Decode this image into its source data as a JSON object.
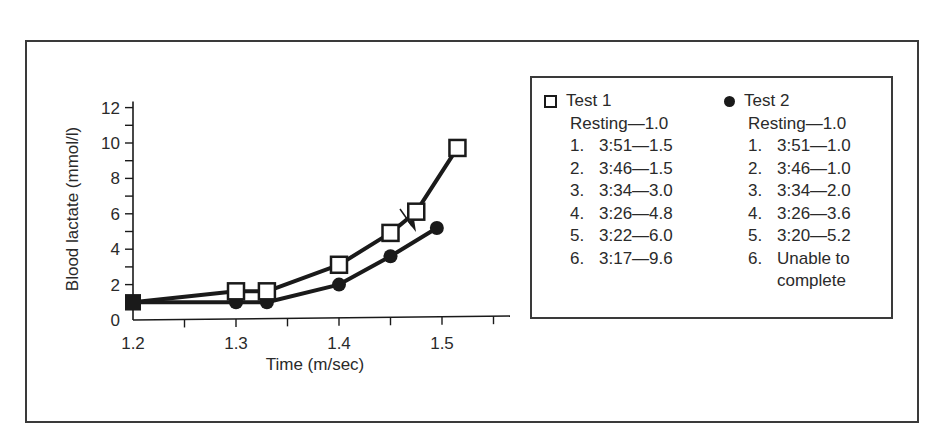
{
  "chart_data": {
    "type": "line",
    "title": "",
    "xlabel": "Time (m/sec)",
    "ylabel": "Blood lactate (mmol/l)",
    "xlim": [
      1.2,
      1.57
    ],
    "ylim": [
      0,
      12
    ],
    "x_ticks": [
      "1.2",
      "1.3",
      "1.4",
      "1.5"
    ],
    "x_minor_ticks": [
      1.25,
      1.35,
      1.45,
      1.55
    ],
    "y_ticks": [
      "0",
      "2",
      "4",
      "6",
      "8",
      "10",
      "12"
    ],
    "y_minor_ticks": [
      1,
      3,
      5,
      7,
      9,
      11
    ],
    "grid": false,
    "legend_position": "right",
    "series": [
      {
        "name": "Test 1",
        "marker": "open-square",
        "x": [
          1.2,
          1.3,
          1.33,
          1.4,
          1.45,
          1.475,
          1.515
        ],
        "y": [
          1.0,
          1.5,
          1.5,
          3.0,
          4.8,
          6.0,
          9.6
        ]
      },
      {
        "name": "Test 2",
        "marker": "filled-circle",
        "x": [
          1.2,
          1.3,
          1.33,
          1.4,
          1.45,
          1.495
        ],
        "y": [
          1.0,
          1.0,
          1.0,
          2.0,
          3.6,
          5.2
        ]
      }
    ],
    "annotations": [
      {
        "type": "arrow",
        "description": "small arrow from Test 1 line between points 4 and 5 pointing down to Test 2 line",
        "x": 1.46,
        "y": 5.5
      }
    ]
  },
  "legend": {
    "test1": {
      "label": "Test 1",
      "resting": "Resting—1.0",
      "rows": [
        {
          "num": "1.",
          "text": "3:51—1.5"
        },
        {
          "num": "2.",
          "text": "3:46—1.5"
        },
        {
          "num": "3.",
          "text": "3:34—3.0"
        },
        {
          "num": "4.",
          "text": "3:26—4.8"
        },
        {
          "num": "5.",
          "text": "3:22—6.0"
        },
        {
          "num": "6.",
          "text": "3:17—9.6"
        }
      ]
    },
    "test2": {
      "label": "Test 2",
      "resting": "Resting—1.0",
      "rows": [
        {
          "num": "1.",
          "text": "3:51—1.0"
        },
        {
          "num": "2.",
          "text": "3:46—1.0"
        },
        {
          "num": "3.",
          "text": "3:34—2.0"
        },
        {
          "num": "4.",
          "text": "3:26—3.6"
        },
        {
          "num": "5.",
          "text": "3:20—5.2"
        },
        {
          "num": "6.",
          "text": "Unable to"
        }
      ],
      "row6_continuation": "complete"
    }
  },
  "colors": {
    "ink": "#1a1a1a",
    "frame": "#3a3a3a",
    "background": "#ffffff"
  }
}
